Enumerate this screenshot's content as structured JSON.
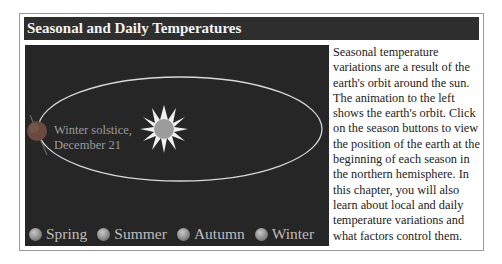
{
  "header": {
    "title": "Seasonal and Daily Temperatures"
  },
  "animation": {
    "caption_line1": "Winter solstice,",
    "caption_line2": "December 21",
    "colors": {
      "background": "#262626",
      "orbit": "#d8d8d8",
      "sun_rays": "#f0f0f0",
      "sun_core": "#9c9c9c",
      "earth": "#6a4a40"
    },
    "season_buttons": [
      {
        "label": "Spring"
      },
      {
        "label": "Summer"
      },
      {
        "label": "Autumn"
      },
      {
        "label": "Winter"
      }
    ]
  },
  "description": "Seasonal temperature variations are a result of the earth's orbit around the sun. The animation to the left shows the earth's orbit. Click on the season buttons to view the position of the earth at the beginning of each season in the northern hemisphere. In this chapter, you will also learn about local and daily temperature variations and what factors control them."
}
